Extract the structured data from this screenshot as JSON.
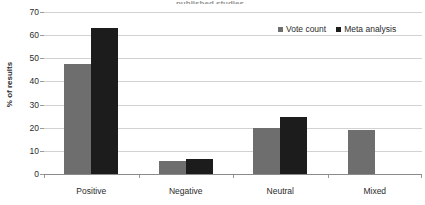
{
  "chart_data": {
    "type": "bar",
    "title": "",
    "xlabel": "",
    "ylabel": "% of results",
    "ylim": [
      0,
      70
    ],
    "ytick_step": 10,
    "yticks": [
      70,
      60,
      50,
      40,
      30,
      20,
      10,
      0
    ],
    "grid": true,
    "legend_position": "top-right",
    "categories": [
      "Positive",
      "Negative",
      "Neutral",
      "Mixed"
    ],
    "series": [
      {
        "name": "Vote count",
        "color": "#6e6e6e",
        "values": [
          47.5,
          5.5,
          20,
          19
        ]
      },
      {
        "name": "Meta analysis",
        "color": "#1c1c1c",
        "values": [
          63,
          6.5,
          24.5,
          null
        ]
      }
    ]
  },
  "legend": {
    "items": [
      {
        "label": "Vote count",
        "color": "#6e6e6e"
      },
      {
        "label": "Meta analysis",
        "color": "#1c1c1c"
      }
    ]
  },
  "axes": {
    "y_title": "% of results",
    "y_labels": [
      "70",
      "60",
      "50",
      "40",
      "30",
      "20",
      "10",
      "0"
    ],
    "x_labels": [
      "Positive",
      "Negative",
      "Neutral",
      "Mixed"
    ]
  },
  "title_sliver": "published studies"
}
